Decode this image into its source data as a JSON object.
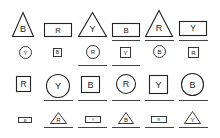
{
  "figure": {
    "stroke_color": "#222222",
    "underline_color": "#444444",
    "background": "#ffffff",
    "rows": [
      {
        "row": 1,
        "items": [
          {
            "shape": "triangle",
            "size": "large",
            "label": "B",
            "underlined": false,
            "x": 12,
            "y": 12,
            "w": 22,
            "h": 25
          },
          {
            "shape": "rectangle",
            "size": "large",
            "label": "R",
            "underlined": false,
            "x": 44,
            "y": 23,
            "w": 28,
            "h": 14
          },
          {
            "shape": "triangle",
            "size": "large",
            "label": "Y",
            "underlined": false,
            "x": 78,
            "y": 12,
            "w": 29,
            "h": 25
          },
          {
            "shape": "rectangle",
            "size": "large",
            "label": "B",
            "underlined": true,
            "x": 112,
            "y": 23,
            "w": 28,
            "h": 14
          },
          {
            "shape": "triangle",
            "size": "large",
            "label": "R",
            "underlined": true,
            "x": 145,
            "y": 10,
            "w": 28,
            "h": 27
          },
          {
            "shape": "rectangle",
            "size": "large",
            "label": "Y",
            "underlined": true,
            "x": 179,
            "y": 21,
            "w": 28,
            "h": 15
          }
        ]
      },
      {
        "row": 2,
        "items": [
          {
            "shape": "circle",
            "size": "small",
            "label": "Y",
            "underlined": false,
            "x": 19,
            "y": 46,
            "w": 13,
            "h": 13
          },
          {
            "shape": "square",
            "size": "small",
            "label": "B",
            "underlined": false,
            "x": 53,
            "y": 48,
            "w": 9,
            "h": 9
          },
          {
            "shape": "circle",
            "size": "small",
            "label": "R",
            "underlined": true,
            "x": 86,
            "y": 45,
            "w": 14,
            "h": 14
          },
          {
            "shape": "square",
            "size": "small",
            "label": "Y",
            "underlined": true,
            "x": 120,
            "y": 47,
            "w": 11,
            "h": 11
          },
          {
            "shape": "circle",
            "size": "small",
            "label": "B",
            "underlined": false,
            "x": 153,
            "y": 45,
            "w": 13,
            "h": 13
          },
          {
            "shape": "square",
            "size": "small",
            "label": "R",
            "underlined": false,
            "x": 188,
            "y": 47,
            "w": 11,
            "h": 11
          }
        ]
      },
      {
        "row": 3,
        "items": [
          {
            "shape": "square",
            "size": "large",
            "label": "R",
            "underlined": false,
            "x": 16,
            "y": 76,
            "w": 15,
            "h": 16
          },
          {
            "shape": "circle",
            "size": "large",
            "label": "Y",
            "underlined": true,
            "x": 46,
            "y": 74,
            "w": 24,
            "h": 24
          },
          {
            "shape": "square",
            "size": "large",
            "label": "B",
            "underlined": true,
            "x": 81,
            "y": 76,
            "w": 19,
            "h": 17
          },
          {
            "shape": "circle",
            "size": "large",
            "label": "R",
            "underlined": true,
            "x": 116,
            "y": 74,
            "w": 20,
            "h": 20
          },
          {
            "shape": "square",
            "size": "large",
            "label": "Y",
            "underlined": true,
            "x": 149,
            "y": 75,
            "w": 19,
            "h": 19
          },
          {
            "shape": "circle",
            "size": "large",
            "label": "B",
            "underlined": true,
            "x": 181,
            "y": 73,
            "w": 23,
            "h": 23
          }
        ]
      },
      {
        "row": 4,
        "items": [
          {
            "shape": "rectangle",
            "size": "small",
            "label": "B",
            "underlined": false,
            "x": 18,
            "y": 117,
            "w": 14,
            "h": 6
          },
          {
            "shape": "triangle",
            "size": "small",
            "label": "R",
            "underlined": true,
            "x": 50,
            "y": 112,
            "w": 17,
            "h": 12
          },
          {
            "shape": "rectangle",
            "size": "small",
            "label": "Y",
            "underlined": true,
            "x": 85,
            "y": 116,
            "w": 16,
            "h": 7
          },
          {
            "shape": "triangle",
            "size": "small",
            "label": "B",
            "underlined": true,
            "x": 118,
            "y": 112,
            "w": 16,
            "h": 12
          },
          {
            "shape": "rectangle",
            "size": "small",
            "label": "R",
            "underlined": true,
            "x": 151,
            "y": 116,
            "w": 16,
            "h": 7
          },
          {
            "shape": "triangle",
            "size": "small",
            "label": "Y",
            "underlined": true,
            "x": 184,
            "y": 111,
            "w": 17,
            "h": 13
          }
        ]
      }
    ],
    "underlines": [
      {
        "row": 1,
        "x": 112,
        "y": 40,
        "w": 28
      },
      {
        "row": 1,
        "x": 145,
        "y": 40,
        "w": 29
      },
      {
        "row": 1,
        "x": 179,
        "y": 40,
        "w": 29
      },
      {
        "row": 2,
        "x": 78,
        "y": 65,
        "w": 29
      },
      {
        "row": 2,
        "x": 112,
        "y": 65,
        "w": 28
      },
      {
        "row": 3,
        "x": 44,
        "y": 100,
        "w": 29
      },
      {
        "row": 3,
        "x": 78,
        "y": 100,
        "w": 29
      },
      {
        "row": 3,
        "x": 112,
        "y": 100,
        "w": 28
      },
      {
        "row": 3,
        "x": 145,
        "y": 100,
        "w": 29
      },
      {
        "row": 3,
        "x": 179,
        "y": 100,
        "w": 29
      },
      {
        "row": 4,
        "x": 44,
        "y": 127,
        "w": 29
      },
      {
        "row": 4,
        "x": 78,
        "y": 127,
        "w": 29
      },
      {
        "row": 4,
        "x": 112,
        "y": 127,
        "w": 28
      },
      {
        "row": 4,
        "x": 145,
        "y": 127,
        "w": 29
      },
      {
        "row": 4,
        "x": 179,
        "y": 127,
        "w": 29
      }
    ]
  }
}
